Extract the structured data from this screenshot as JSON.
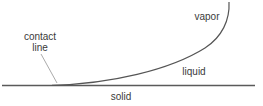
{
  "diagram": {
    "labels": {
      "vapor": "vapor",
      "liquid": "liquid",
      "solid": "solid",
      "contact_line_1": "contact",
      "contact_line_2": "line"
    },
    "colors": {
      "line": "#555555",
      "pointer": "#999999",
      "text": "#3a3a3a"
    }
  }
}
